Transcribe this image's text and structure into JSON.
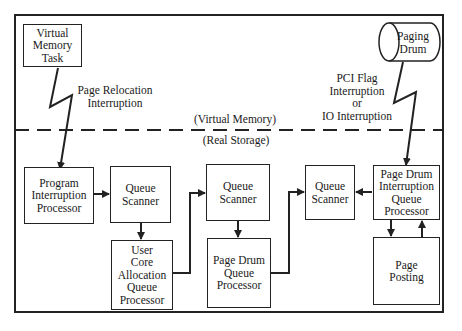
{
  "diagram": {
    "regions": {
      "upper_label": "(Virtual Memory)",
      "lower_label": "(Real Storage)"
    },
    "nodes": {
      "virtual_memory_task": "Virtual\nMemory\nTask",
      "paging_drum": "Paging\nDrum",
      "program_interruption_processor": "Program\nInterruption\nProcessor",
      "queue_scanner_1": "Queue\nScanner",
      "user_core_allocation_queue_processor": "User\nCore\nAllocation\nQueue\nProcessor",
      "queue_scanner_2": "Queue\nScanner",
      "page_drum_queue_processor": "Page Drum\nQueue\nProcessor",
      "queue_scanner_3": "Queue\nScanner",
      "page_drum_interruption_queue_processor": "Page Drum\nInterruption\nQueue\nProcessor",
      "page_posting": "Page\nPosting"
    },
    "edge_labels": {
      "page_relocation": "Page Relocation\nInterruption",
      "pci_flag": "PCI Flag\nInterruption\nor\nIO Interruption"
    },
    "edges": [
      {
        "from": "virtual_memory_task",
        "to": "program_interruption_processor",
        "label": "Page Relocation Interruption",
        "style": "lightning"
      },
      {
        "from": "paging_drum",
        "to": "page_drum_interruption_queue_processor",
        "label": "PCI Flag Interruption or IO Interruption",
        "style": "lightning"
      },
      {
        "from": "program_interruption_processor",
        "to": "queue_scanner_1"
      },
      {
        "from": "queue_scanner_1",
        "to": "user_core_allocation_queue_processor"
      },
      {
        "from": "user_core_allocation_queue_processor",
        "to": "queue_scanner_2"
      },
      {
        "from": "queue_scanner_2",
        "to": "page_drum_queue_processor"
      },
      {
        "from": "page_drum_queue_processor",
        "to": "queue_scanner_3"
      },
      {
        "from": "page_drum_interruption_queue_processor",
        "to": "queue_scanner_3"
      },
      {
        "from": "page_drum_interruption_queue_processor",
        "to": "page_posting"
      },
      {
        "from": "page_posting",
        "to": "page_drum_interruption_queue_processor"
      }
    ]
  }
}
